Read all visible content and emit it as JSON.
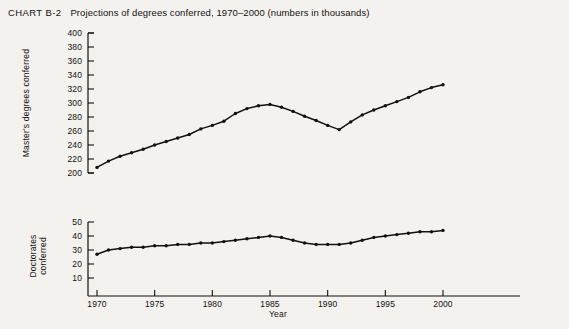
{
  "chart": {
    "label": "CHART B-2",
    "title": "Projections of degrees conferred, 1970–2000 (numbers in thousands)",
    "xaxis_title": "Year",
    "top_ylabel": "Master's degrees conferred",
    "bottom_ylabel_line1": "Doctorates",
    "bottom_ylabel_line2": "conferred",
    "xtick_labels": [
      "1970",
      "1975",
      "1980",
      "1985",
      "1990",
      "1995",
      "2000"
    ],
    "top_ytick_labels": [
      "400",
      "380",
      "360",
      "340",
      "320",
      "300",
      "280",
      "260",
      "240",
      "220",
      "200"
    ],
    "bottom_ytick_labels": [
      "50",
      "40",
      "30",
      "20",
      "10"
    ],
    "line_color": "#111111",
    "background_color": "#f4f2ee"
  },
  "chart_data": [
    {
      "type": "line",
      "title": "Master's degrees conferred",
      "xlabel": "Year",
      "ylabel": "Master's degrees conferred",
      "xlim": [
        1970,
        2000
      ],
      "ylim": [
        200,
        400
      ],
      "grid": false,
      "legend": "none",
      "x": [
        1970,
        1971,
        1972,
        1973,
        1974,
        1975,
        1976,
        1977,
        1978,
        1979,
        1980,
        1981,
        1982,
        1983,
        1984,
        1985,
        1986,
        1987,
        1988,
        1989,
        1990,
        1991,
        1992,
        1993,
        1994,
        1995,
        1996,
        1997,
        1998,
        1999,
        2000
      ],
      "values": [
        208,
        217,
        224,
        229,
        234,
        240,
        245,
        250,
        255,
        263,
        268,
        274,
        285,
        292,
        296,
        298,
        294,
        288,
        281,
        275,
        268,
        262,
        273,
        283,
        290,
        296,
        302,
        308,
        316,
        322,
        326,
        330,
        334,
        340,
        345,
        350,
        355
      ]
    },
    {
      "type": "line",
      "title": "Doctorates conferred",
      "xlabel": "Year",
      "ylabel": "Doctorates conferred",
      "xlim": [
        1970,
        2000
      ],
      "ylim": [
        5,
        55
      ],
      "grid": false,
      "legend": "none",
      "x": [
        1970,
        1971,
        1972,
        1973,
        1974,
        1975,
        1976,
        1977,
        1978,
        1979,
        1980,
        1981,
        1982,
        1983,
        1984,
        1985,
        1986,
        1987,
        1988,
        1989,
        1990,
        1991,
        1992,
        1993,
        1994,
        1995,
        1996,
        1997,
        1998,
        1999,
        2000
      ],
      "values": [
        27,
        30,
        31,
        32,
        32,
        33,
        33,
        34,
        34,
        35,
        35,
        36,
        37,
        38,
        39,
        40,
        39,
        37,
        35,
        34,
        34,
        34,
        35,
        37,
        39,
        40,
        41,
        42,
        43,
        43,
        44,
        45,
        45,
        46,
        46,
        47,
        47
      ]
    }
  ]
}
